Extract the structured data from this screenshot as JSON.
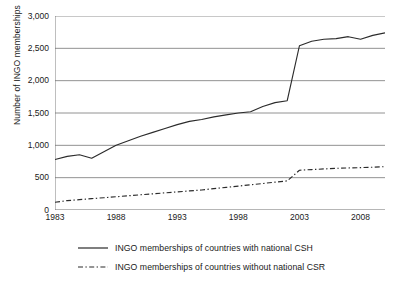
{
  "chart_data": {
    "type": "line",
    "title": "",
    "xlabel": "",
    "ylabel": "Number of INGO memberships",
    "xlim": [
      1983,
      2010
    ],
    "ylim": [
      0,
      3000
    ],
    "ytick_labels": [
      "0",
      "500",
      "1,000",
      "1,500",
      "2,000",
      "2,500",
      "3,000"
    ],
    "ytick_values": [
      0,
      500,
      1000,
      1500,
      2000,
      2500,
      3000
    ],
    "xtick_labels": [
      "1983",
      "1988",
      "1993",
      "1998",
      "2003",
      "2008"
    ],
    "xtick_values": [
      1983,
      1988,
      1993,
      1998,
      2003,
      2008
    ],
    "grid": "horizontal",
    "legend_position": "bottom",
    "x": [
      1983,
      1984,
      1985,
      1986,
      1987,
      1988,
      1989,
      1990,
      1991,
      1992,
      1993,
      1994,
      1995,
      1996,
      1997,
      1998,
      1999,
      2000,
      2001,
      2002,
      2003,
      2004,
      2005,
      2006,
      2007,
      2008,
      2009,
      2010
    ],
    "series": [
      {
        "name": "INGO memberships of countries with national CSH",
        "style": "solid",
        "color": "#2b2b2b",
        "values": [
          780,
          830,
          855,
          800,
          900,
          1000,
          1070,
          1140,
          1200,
          1260,
          1320,
          1370,
          1400,
          1440,
          1470,
          1500,
          1520,
          1600,
          1660,
          1690,
          2540,
          2610,
          2640,
          2650,
          2680,
          2640,
          2700,
          2740
        ]
      },
      {
        "name": "INGO memberships of countries without national CSR",
        "style": "dash-dot",
        "color": "#2b2b2b",
        "values": [
          120,
          145,
          160,
          175,
          190,
          205,
          220,
          235,
          250,
          265,
          280,
          295,
          310,
          330,
          350,
          370,
          390,
          410,
          430,
          450,
          615,
          625,
          635,
          645,
          650,
          655,
          662,
          670
        ]
      }
    ]
  },
  "legend": {
    "items": [
      {
        "label": "INGO memberships of countries with national CSH",
        "style": "solid"
      },
      {
        "label": "INGO memberships of countries without national CSR",
        "style": "dash-dot"
      }
    ]
  }
}
